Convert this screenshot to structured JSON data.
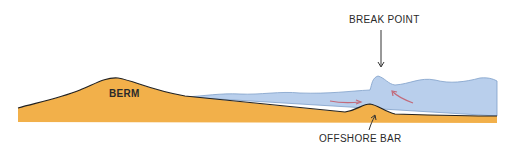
{
  "diagram": {
    "labels": {
      "berm": "BERM",
      "break_point": "BREAK POINT",
      "offshore_bar": "OFFSHORE BAR"
    },
    "colors": {
      "sand": "#f2b04a",
      "water": "#b9cfec",
      "outline": "#222222",
      "current_arrow": "#c26a7a"
    }
  }
}
